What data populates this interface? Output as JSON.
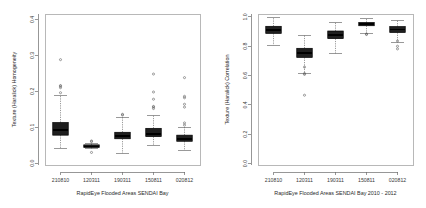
{
  "figure": {
    "background": "#ffffff",
    "width": 426,
    "height": 208,
    "panel_count": 2
  },
  "chart_data": [
    {
      "id": "left",
      "type": "box",
      "title": "",
      "xlabel": "RapidEye Flooded Areas SENDAI Bay",
      "ylabel": "Texture (Haralick) Homogeneity",
      "categories": [
        "210810",
        "120311",
        "190311",
        "150811",
        "020812"
      ],
      "xtick_labels": [
        "210810",
        "120311",
        "190311",
        "150811",
        "020812"
      ],
      "ytick_labels": [
        "0.0",
        "0.1",
        "0.2",
        "0.3",
        "0.4"
      ],
      "ytick_values": [
        0.0,
        0.1,
        0.2,
        0.3,
        0.4
      ],
      "ylim": [
        -0.005,
        0.415
      ],
      "grid": false,
      "legend": "none",
      "boxes": [
        {
          "category": "210810",
          "whisker_low": 0.042,
          "q1": 0.078,
          "median": 0.093,
          "q3": 0.113,
          "whisker_high": 0.188,
          "outliers": [
            0.196,
            0.21,
            0.214,
            0.216,
            0.288
          ]
        },
        {
          "category": "120311",
          "whisker_low": 0.04,
          "q1": 0.044,
          "median": 0.047,
          "q3": 0.051,
          "whisker_high": 0.056,
          "outliers": [
            0.03,
            0.06,
            0.062
          ]
        },
        {
          "category": "190311",
          "whisker_low": 0.028,
          "q1": 0.068,
          "median": 0.076,
          "q3": 0.086,
          "whisker_high": 0.128,
          "outliers": [
            0.134,
            0.136
          ]
        },
        {
          "category": "150811",
          "whisker_low": 0.05,
          "q1": 0.074,
          "median": 0.082,
          "q3": 0.097,
          "whisker_high": 0.132,
          "outliers": [
            0.152,
            0.156,
            0.158,
            0.178,
            0.198,
            0.248
          ]
        },
        {
          "category": "020812",
          "whisker_low": 0.036,
          "q1": 0.061,
          "median": 0.068,
          "q3": 0.078,
          "whisker_high": 0.1,
          "outliers": [
            0.106,
            0.112,
            0.156,
            0.164,
            0.182,
            0.186,
            0.238
          ]
        }
      ]
    },
    {
      "id": "right",
      "type": "box",
      "title": "",
      "xlabel": "RapidEye Flooded Areas SENDAI Bay 2010 - 2012",
      "ylabel": "Texture (Haralick) Correlation",
      "categories": [
        "210810",
        "120311",
        "190311",
        "150811",
        "020812"
      ],
      "xtick_labels": [
        "210810",
        "120311",
        "190311",
        "150811",
        "020812"
      ],
      "ytick_labels": [
        "0.0",
        "0.2",
        "0.4",
        "0.6",
        "0.8",
        "1.0"
      ],
      "ytick_values": [
        0.0,
        0.2,
        0.4,
        0.6,
        0.8,
        1.0
      ],
      "ylim": [
        -0.01,
        1.02
      ],
      "grid": false,
      "legend": "none",
      "boxes": [
        {
          "category": "210810",
          "whisker_low": 0.808,
          "q1": 0.888,
          "median": 0.912,
          "q3": 0.936,
          "whisker_high": 0.995,
          "outliers": []
        },
        {
          "category": "120311",
          "whisker_low": 0.612,
          "q1": 0.724,
          "median": 0.752,
          "q3": 0.786,
          "whisker_high": 0.876,
          "outliers": [
            0.466,
            0.608,
            0.614,
            0.658
          ]
        },
        {
          "category": "190311",
          "whisker_low": 0.752,
          "q1": 0.852,
          "median": 0.876,
          "q3": 0.904,
          "whisker_high": 0.962,
          "outliers": []
        },
        {
          "category": "150811",
          "whisker_low": 0.884,
          "q1": 0.94,
          "median": 0.952,
          "q3": 0.962,
          "whisker_high": 0.992,
          "outliers": [
            0.88,
            0.884
          ]
        },
        {
          "category": "020812",
          "whisker_low": 0.828,
          "q1": 0.894,
          "median": 0.914,
          "q3": 0.934,
          "whisker_high": 0.978,
          "outliers": [
            0.782,
            0.8,
            0.836
          ]
        }
      ]
    }
  ],
  "style": {
    "box_fill": "#1f1f1f",
    "box_stroke": "#000000",
    "median_stroke": "#000000",
    "whisker_stroke": "#555555",
    "frame_stroke": "#9a9a9a",
    "axis_stroke": "#6b6b6b",
    "text_color": "#2b2b2b"
  }
}
